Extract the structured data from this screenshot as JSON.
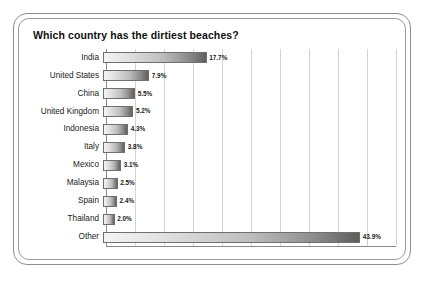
{
  "chart_data": {
    "type": "bar",
    "orientation": "horizontal",
    "title": "Which country has the dirtiest beaches?",
    "xlabel": "",
    "ylabel": "",
    "xlim": [
      0,
      50
    ],
    "grid": true,
    "gridlines_every": 5,
    "legend": "none",
    "value_suffix": "%",
    "categories": [
      "India",
      "United States",
      "China",
      "United Kingdom",
      "Indonesia",
      "Italy",
      "Mexico",
      "Malaysia",
      "Spain",
      "Thailand",
      "Other"
    ],
    "values": [
      17.7,
      7.9,
      5.5,
      5.2,
      4.3,
      3.8,
      3.1,
      2.5,
      2.4,
      2.0,
      43.9
    ],
    "value_labels": [
      "17.7%",
      "7.9%",
      "5.5%",
      "5.2%",
      "4.3%",
      "3.8%",
      "3.1%",
      "2.5%",
      "2.4%",
      "2.0%",
      "43.9%"
    ],
    "bars": [
      {
        "label": "India",
        "value": 17.7,
        "value_label": "17.7%"
      },
      {
        "label": "United States",
        "value": 7.9,
        "value_label": "7.9%"
      },
      {
        "label": "China",
        "value": 5.5,
        "value_label": "5.5%"
      },
      {
        "label": "United Kingdom",
        "value": 5.2,
        "value_label": "5.2%"
      },
      {
        "label": "Indonesia",
        "value": 4.3,
        "value_label": "4.3%"
      },
      {
        "label": "Italy",
        "value": 3.8,
        "value_label": "3.8%"
      },
      {
        "label": "Mexico",
        "value": 3.1,
        "value_label": "3.1%"
      },
      {
        "label": "Malaysia",
        "value": 2.5,
        "value_label": "2.5%"
      },
      {
        "label": "Spain",
        "value": 2.4,
        "value_label": "2.4%"
      },
      {
        "label": "Thailand",
        "value": 2.0,
        "value_label": "2.0%"
      },
      {
        "label": "Other",
        "value": 43.9,
        "value_label": "43.9%"
      }
    ],
    "colors": {
      "bar_gradient_start": "#f4f4f4",
      "bar_gradient_end": "#5e5e5e",
      "bar_border": "#6f6f6f",
      "gridline": "#d3d3d3",
      "axis": "#8a8a8a",
      "frame": "#8e8e8e",
      "text": "#111111",
      "background": "#ffffff"
    }
  }
}
